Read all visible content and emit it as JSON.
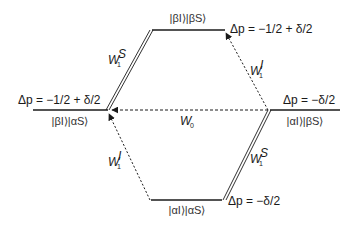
{
  "diagram": {
    "type": "energy-level / transition diagram",
    "levels": {
      "top": {
        "state": "|βI⟩|βS⟩",
        "energy": "Δp = −1/2 + δ/2"
      },
      "left": {
        "state": "|βI⟩|αS⟩",
        "energy": "Δp = −1/2 + δ/2"
      },
      "right": {
        "state": "|αI⟩|βS⟩",
        "energy": "Δp = −δ/2"
      },
      "bottom": {
        "state": "|αI⟩|αS⟩",
        "energy": "Δp = −δ/2"
      }
    },
    "transitions": {
      "W1S_upper": {
        "label": "W",
        "sub": "1",
        "sup": "S",
        "style": "double-line"
      },
      "W1S_lower": {
        "label": "W",
        "sub": "1",
        "sup": "S",
        "style": "double-line"
      },
      "W1I_upper": {
        "label": "W",
        "sub": "1",
        "sup": "I",
        "style": "dotted-arrow"
      },
      "W1I_lower": {
        "label": "W",
        "sub": "1",
        "sup": "I",
        "style": "dotted-arrow"
      },
      "W0": {
        "label": "W",
        "sub": "0",
        "style": "dashed-arrow"
      }
    },
    "colors": {
      "line": "#1a1a1a",
      "background": "#ffffff"
    }
  }
}
